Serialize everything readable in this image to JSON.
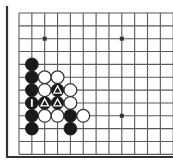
{
  "board": {
    "kind": "go-board-diagram",
    "description": "Go (weiqi/baduk) board corner diagram showing a local fight in the lower-left",
    "corner_shown": "lower-left",
    "width_px": 173,
    "height_px": 165,
    "background_color": "#ffffff",
    "line_color": "#595959",
    "edge_line_color": "#333333",
    "black_color": "#1a1a1a",
    "white_color": "#ffffff",
    "white_outline_color": "#333333",
    "mark_color_on_black": "#ffffff",
    "grid": {
      "origin_x": 19,
      "origin_y": 13,
      "spacing": 12.85,
      "cols": 12,
      "rows": 11,
      "show_grid": true,
      "border_left_x": 7,
      "border_bottom_y": 157
    },
    "stone_radius": 6.4,
    "star_points": [
      {
        "col": 2,
        "row": 2
      },
      {
        "col": 8,
        "row": 2
      },
      {
        "col": 8,
        "row": 8
      }
    ],
    "stones": [
      {
        "col": 1,
        "row": 4,
        "color": "black",
        "mark": "none"
      },
      {
        "col": 1,
        "row": 5,
        "color": "black",
        "mark": "none"
      },
      {
        "col": 1,
        "row": 6,
        "color": "black",
        "mark": "none"
      },
      {
        "col": 1,
        "row": 7,
        "color": "black",
        "mark": "bar"
      },
      {
        "col": 1,
        "row": 8,
        "color": "black",
        "mark": "none"
      },
      {
        "col": 1,
        "row": 9,
        "color": "black",
        "mark": "none"
      },
      {
        "col": 2,
        "row": 5,
        "color": "white",
        "mark": "none"
      },
      {
        "col": 2,
        "row": 6,
        "color": "white",
        "mark": "none"
      },
      {
        "col": 2,
        "row": 7,
        "color": "black",
        "mark": "triangle"
      },
      {
        "col": 2,
        "row": 8,
        "color": "white",
        "mark": "none"
      },
      {
        "col": 3,
        "row": 5,
        "color": "white",
        "mark": "none"
      },
      {
        "col": 3,
        "row": 6,
        "color": "black",
        "mark": "triangle"
      },
      {
        "col": 3,
        "row": 7,
        "color": "black",
        "mark": "triangle"
      },
      {
        "col": 3,
        "row": 8,
        "color": "white",
        "mark": "none"
      },
      {
        "col": 4,
        "row": 6,
        "color": "white",
        "mark": "none"
      },
      {
        "col": 4,
        "row": 7,
        "color": "white",
        "mark": "none"
      },
      {
        "col": 4,
        "row": 8,
        "color": "black",
        "mark": "none"
      },
      {
        "col": 4,
        "row": 9,
        "color": "black",
        "mark": "none"
      },
      {
        "col": 5,
        "row": 8,
        "color": "white",
        "mark": "none"
      }
    ],
    "legend": {
      "black_label": "Black stone",
      "white_label": "White stone",
      "triangle_label": "Triangle marked stone",
      "bar_label": "Bar marked stone",
      "star_label": "Star point (hoshi)"
    }
  }
}
